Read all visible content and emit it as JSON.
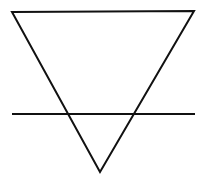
{
  "diagram": {
    "symbol": "earth-alchemical-symbol",
    "stroke_color": "#111111",
    "background_color": "#ffffff",
    "stroke_width": 2,
    "triangle": {
      "points": [
        [
          12,
          12
        ],
        [
          194,
          11
        ],
        [
          100,
          172
        ]
      ]
    },
    "crossbar": {
      "x1": 12,
      "y1": 114,
      "x2": 195,
      "y2": 114
    }
  }
}
